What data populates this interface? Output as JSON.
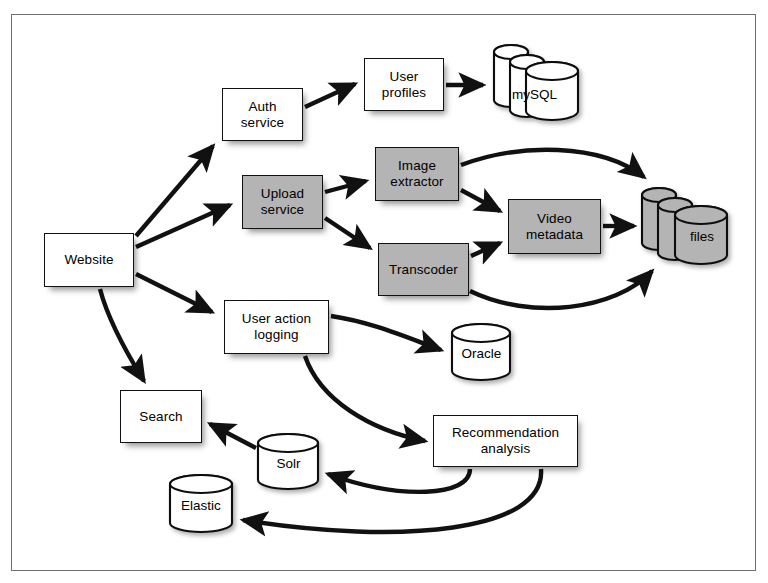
{
  "diagram": {
    "frame": {
      "border_color": "#6f6f6f"
    },
    "colors": {
      "shaded_fill": "#b4b4b4",
      "plain_fill": "#ffffff",
      "stroke": "#111111",
      "background": "#ffffff"
    },
    "nodes": [
      {
        "id": "website",
        "label": "Website",
        "shape": "box",
        "fill": "plain",
        "x": 44,
        "y": 233,
        "w": 90,
        "h": 54
      },
      {
        "id": "auth-service",
        "label": "Auth\nservice",
        "shape": "box",
        "fill": "plain",
        "x": 222,
        "y": 88,
        "w": 81,
        "h": 53
      },
      {
        "id": "user-profiles",
        "label": "User\nprofiles",
        "shape": "box",
        "fill": "plain",
        "x": 364,
        "y": 58,
        "w": 80,
        "h": 53
      },
      {
        "id": "mysql",
        "label": "mySQL",
        "shape": "cylinder-stack",
        "fill": "plain",
        "x": 492,
        "y": 40,
        "w": 89,
        "h": 83
      },
      {
        "id": "upload-service",
        "label": "Upload\nservice",
        "shape": "box",
        "fill": "shaded",
        "x": 242,
        "y": 175,
        "w": 81,
        "h": 54
      },
      {
        "id": "image-extractor",
        "label": "Image\nextractor",
        "shape": "box",
        "fill": "shaded",
        "x": 375,
        "y": 147,
        "w": 84,
        "h": 54
      },
      {
        "id": "transcoder",
        "label": "Transcoder",
        "shape": "box",
        "fill": "shaded",
        "x": 378,
        "y": 243,
        "w": 91,
        "h": 53
      },
      {
        "id": "video-metadata",
        "label": "Video\nmetadata",
        "shape": "box",
        "fill": "shaded",
        "x": 508,
        "y": 199,
        "w": 93,
        "h": 55
      },
      {
        "id": "files",
        "label": "files",
        "shape": "cylinder-stack",
        "fill": "shaded",
        "x": 640,
        "y": 184,
        "w": 90,
        "h": 83
      },
      {
        "id": "user-action-logging",
        "label": "User action\nlogging",
        "shape": "box",
        "fill": "plain",
        "x": 224,
        "y": 300,
        "w": 105,
        "h": 54
      },
      {
        "id": "oracle",
        "label": "Oracle",
        "shape": "cylinder",
        "fill": "plain",
        "x": 450,
        "y": 322,
        "w": 63,
        "h": 61
      },
      {
        "id": "search",
        "label": "Search",
        "shape": "box",
        "fill": "plain",
        "x": 120,
        "y": 390,
        "w": 82,
        "h": 53
      },
      {
        "id": "solr",
        "label": "Solr",
        "shape": "cylinder",
        "fill": "plain",
        "x": 256,
        "y": 432,
        "w": 65,
        "h": 60
      },
      {
        "id": "elastic",
        "label": "Elastic",
        "shape": "cylinder",
        "fill": "plain",
        "x": 168,
        "y": 473,
        "w": 66,
        "h": 62
      },
      {
        "id": "recommendation-analysis",
        "label": "Recommendation\nanalysis",
        "shape": "box",
        "fill": "plain",
        "x": 433,
        "y": 415,
        "w": 145,
        "h": 52
      }
    ],
    "edges": [
      {
        "from": "website",
        "to": "auth-service",
        "style": "straight"
      },
      {
        "from": "website",
        "to": "upload-service",
        "style": "straight"
      },
      {
        "from": "website",
        "to": "user-action-logging",
        "style": "straight"
      },
      {
        "from": "website",
        "to": "search",
        "style": "curved"
      },
      {
        "from": "auth-service",
        "to": "user-profiles",
        "style": "straight"
      },
      {
        "from": "user-profiles",
        "to": "mysql",
        "style": "straight"
      },
      {
        "from": "upload-service",
        "to": "image-extractor",
        "style": "straight"
      },
      {
        "from": "upload-service",
        "to": "transcoder",
        "style": "straight"
      },
      {
        "from": "image-extractor",
        "to": "files",
        "style": "curved"
      },
      {
        "from": "image-extractor",
        "to": "video-metadata",
        "style": "straight"
      },
      {
        "from": "transcoder",
        "to": "video-metadata",
        "style": "straight"
      },
      {
        "from": "transcoder",
        "to": "files",
        "style": "curved"
      },
      {
        "from": "video-metadata",
        "to": "files",
        "style": "straight"
      },
      {
        "from": "user-action-logging",
        "to": "oracle",
        "style": "curved"
      },
      {
        "from": "user-action-logging",
        "to": "recommendation-analysis",
        "style": "curved"
      },
      {
        "from": "recommendation-analysis",
        "to": "solr",
        "style": "curved"
      },
      {
        "from": "recommendation-analysis",
        "to": "elastic",
        "style": "curved"
      },
      {
        "from": "solr",
        "to": "search",
        "style": "straight"
      }
    ]
  }
}
